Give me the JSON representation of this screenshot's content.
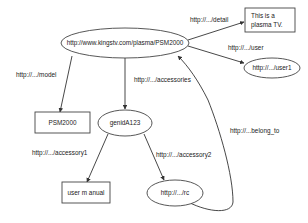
{
  "diagram": {
    "nodes": {
      "main": {
        "label": "http://www.kingstv.com/plasma/PSM2000",
        "shape": "ellipse"
      },
      "detail": {
        "line1": "This  is a",
        "line2": "plasma  TV.",
        "shape": "rect"
      },
      "user1": {
        "label": "http://.../user1",
        "shape": "ellipse"
      },
      "model": {
        "label": "PSM2000",
        "shape": "rect"
      },
      "genid": {
        "label": "genidA123",
        "shape": "ellipse"
      },
      "manual": {
        "label": "user m anual",
        "shape": "rect"
      },
      "rc": {
        "label": "http://.../rc",
        "shape": "ellipse"
      }
    },
    "edges": {
      "detail": {
        "label": "http://.../detail",
        "from": "main",
        "to": "detail"
      },
      "user": {
        "label": "http://.../user",
        "from": "main",
        "to": "user1"
      },
      "model": {
        "label": "http://.../model",
        "from": "main",
        "to": "model"
      },
      "accessories": {
        "label": "http://.../accessories",
        "from": "main",
        "to": "genid"
      },
      "accessory1": {
        "label": "http://.../accessory1",
        "from": "genid",
        "to": "manual"
      },
      "accessory2": {
        "label": "http://.../accessory2",
        "from": "genid",
        "to": "rc"
      },
      "belong_to": {
        "label": "http://...belong_to",
        "from": "rc",
        "to": "main"
      }
    }
  }
}
